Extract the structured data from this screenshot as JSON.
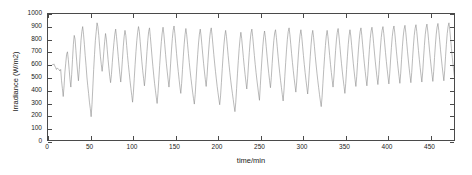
{
  "figure": {
    "background_color": "#ffffff",
    "axis_color": "#4a4a4a",
    "series_color": "#8c8c8c"
  },
  "chart_data": {
    "type": "line",
    "title": "",
    "subtitle": "",
    "xlabel": "time/min",
    "ylabel": "Irradiance (W/m2)",
    "xlim": [
      0,
      480
    ],
    "ylim": [
      0,
      1000
    ],
    "xticks": [
      0,
      50,
      100,
      150,
      200,
      250,
      300,
      350,
      400,
      450
    ],
    "yticks": [
      0,
      100,
      200,
      300,
      400,
      500,
      600,
      700,
      800,
      900,
      1000
    ],
    "xticklabels": [
      "0",
      "50",
      "100",
      "150",
      "200",
      "250",
      "300",
      "350",
      "400",
      "450"
    ],
    "yticklabels": [
      "0",
      "100",
      "200",
      "300",
      "400",
      "500",
      "600",
      "700",
      "800",
      "900",
      "1000"
    ],
    "grid": false,
    "legend": null,
    "box": true,
    "tick_direction": "in",
    "series": [
      {
        "name": "Irradiance",
        "color": "#8c8c8c",
        "linewidth": 0.6,
        "x_start": 5,
        "x_step": 1,
        "summary": {
          "n_points": 476,
          "min": 180,
          "max": 965,
          "mean": 648,
          "description": "Minute-resolution solar irradiance with strong high-frequency fluctuation between roughly 180 and 965 W/m2."
        },
        "values": [
          600,
          596,
          604,
          588,
          575,
          560,
          572,
          565,
          558,
          548,
          560,
          470,
          410,
          345,
          430,
          540,
          610,
          680,
          700,
          640,
          560,
          480,
          420,
          520,
          640,
          760,
          830,
          800,
          710,
          620,
          540,
          470,
          560,
          680,
          790,
          860,
          900,
          840,
          760,
          670,
          590,
          500,
          430,
          370,
          300,
          250,
          185,
          280,
          420,
          560,
          680,
          790,
          860,
          930,
          900,
          830,
          745,
          660,
          600,
          545,
          610,
          700,
          780,
          845,
          800,
          720,
          640,
          570,
          505,
          455,
          520,
          615,
          700,
          775,
          840,
          880,
          820,
          745,
          665,
          590,
          520,
          460,
          540,
          640,
          740,
          820,
          870,
          830,
          750,
          670,
          600,
          535,
          470,
          410,
          355,
          300,
          380,
          490,
          600,
          700,
          790,
          855,
          900,
          860,
          780,
          700,
          620,
          550,
          490,
          430,
          500,
          600,
          700,
          790,
          860,
          890,
          820,
          740,
          660,
          585,
          515,
          450,
          395,
          340,
          290,
          370,
          480,
          590,
          690,
          780,
          850,
          895,
          840,
          760,
          680,
          605,
          540,
          480,
          420,
          500,
          610,
          715,
          805,
          870,
          905,
          845,
          765,
          685,
          610,
          545,
          480,
          420,
          370,
          450,
          560,
          665,
          760,
          835,
          885,
          835,
          760,
          685,
          615,
          550,
          490,
          435,
          380,
          330,
          285,
          360,
          470,
          580,
          680,
          770,
          840,
          880,
          825,
          750,
          675,
          605,
          540,
          480,
          425,
          505,
          615,
          715,
          800,
          860,
          890,
          830,
          755,
          680,
          610,
          545,
          485,
          425,
          375,
          325,
          280,
          350,
          455,
          565,
          665,
          755,
          825,
          870,
          820,
          745,
          670,
          600,
          535,
          475,
          420,
          370,
          320,
          270,
          225,
          300,
          410,
          525,
          630,
          725,
          800,
          855,
          805,
          730,
          655,
          585,
          520,
          460,
          405,
          485,
          595,
          695,
          785,
          850,
          880,
          820,
          745,
          670,
          600,
          535,
          475,
          420,
          365,
          315,
          430,
          545,
          650,
          745,
          820,
          865,
          815,
          740,
          665,
          595,
          530,
          470,
          415,
          495,
          605,
          705,
          790,
          850,
          875,
          815,
          740,
          665,
          595,
          530,
          470,
          415,
          360,
          310,
          395,
          505,
          615,
          715,
          800,
          860,
          890,
          835,
          760,
          685,
          615,
          550,
          490,
          435,
          380,
          460,
          570,
          675,
          765,
          835,
          875,
          820,
          745,
          670,
          600,
          535,
          475,
          420,
          365,
          445,
          555,
          660,
          755,
          830,
          870,
          815,
          740,
          665,
          595,
          530,
          470,
          415,
          360,
          310,
          265,
          340,
          450,
          560,
          660,
          750,
          825,
          870,
          820,
          745,
          670,
          600,
          535,
          475,
          420,
          500,
          610,
          710,
          795,
          855,
          885,
          825,
          750,
          675,
          605,
          540,
          480,
          425,
          370,
          450,
          560,
          665,
          760,
          830,
          875,
          825,
          750,
          675,
          605,
          540,
          480,
          425,
          505,
          615,
          715,
          800,
          860,
          890,
          830,
          755,
          680,
          610,
          545,
          485,
          430,
          510,
          620,
          720,
          805,
          865,
          895,
          840,
          765,
          690,
          620,
          555,
          495,
          440,
          520,
          630,
          730,
          815,
          870,
          900,
          845,
          770,
          695,
          625,
          560,
          500,
          445,
          525,
          635,
          735,
          820,
          875,
          905,
          850,
          775,
          700,
          630,
          565,
          505,
          450,
          530,
          640,
          740,
          825,
          880,
          910,
          855,
          780,
          705,
          635,
          570,
          510,
          455,
          535,
          645,
          745,
          830,
          885,
          915,
          860,
          785,
          710,
          640,
          575,
          515,
          460,
          540,
          650,
          750,
          835,
          890,
          920,
          865,
          790,
          715,
          645,
          580,
          520,
          465,
          545,
          655,
          755,
          840,
          895,
          925,
          870,
          795,
          720,
          650,
          585,
          525,
          470,
          550,
          660,
          760,
          845,
          900,
          930,
          875,
          800,
          725,
          655,
          590,
          530,
          475,
          555,
          665,
          765,
          850,
          905,
          935,
          880,
          805,
          730,
          660,
          595,
          535,
          480,
          560,
          670,
          770,
          855,
          910,
          940,
          885,
          810,
          735,
          665
        ]
      }
    ]
  }
}
